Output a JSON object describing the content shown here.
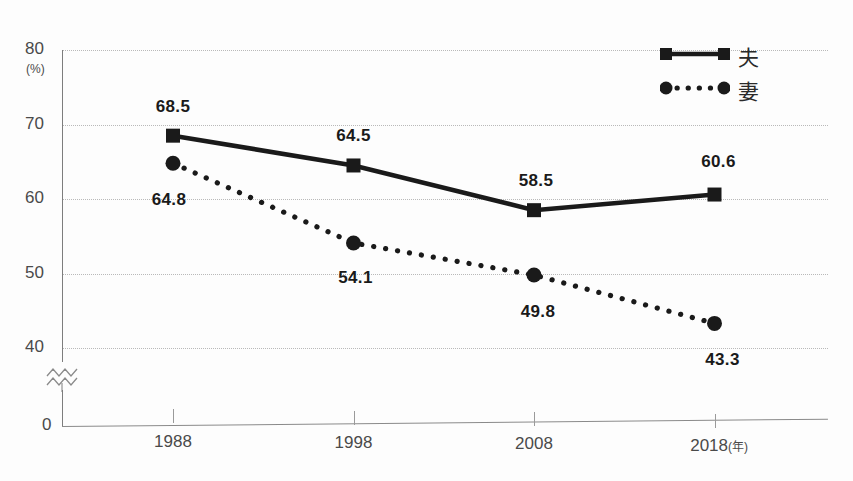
{
  "figure": {
    "caption": "",
    "background_color": "#fdfdfd",
    "ink_color": "#1a1a1a",
    "grid_color": "#b9b9b9"
  },
  "legend": {
    "position": "top-right",
    "entries": [
      {
        "label": "夫",
        "marker": "square",
        "line_style": "solid",
        "icon": "legend-line-solid-square-icon"
      },
      {
        "label": "妻",
        "marker": "circle",
        "line_style": "dotted",
        "icon": "legend-line-dotted-circle-icon"
      }
    ]
  },
  "axes": {
    "y_unit": "(%)",
    "y_ticks": [
      "80",
      "70",
      "60",
      "50",
      "40"
    ],
    "y_zero": "0",
    "y_break_icon": "axis-break-zigzag-icon",
    "x_ticks": [
      "1988",
      "1998",
      "2008",
      "2018"
    ],
    "x_unit": "(年)"
  },
  "chart_data": {
    "type": "line",
    "title": "",
    "xlabel": "年",
    "ylabel": "(%)",
    "x": [
      1988,
      1998,
      2008,
      2018
    ],
    "categories": [
      "1988",
      "1998",
      "2008",
      "2018"
    ],
    "ylim": [
      35,
      80
    ],
    "yticks": [
      40,
      50,
      60,
      70,
      80
    ],
    "axis_break": true,
    "grid": true,
    "legend_position": "top-right",
    "series": [
      {
        "name": "夫",
        "marker": "square",
        "line_style": "solid",
        "color": "#1a1a1a",
        "values": [
          68.5,
          64.5,
          58.5,
          60.6
        ],
        "labels": [
          "68.5",
          "64.5",
          "58.5",
          "60.6"
        ]
      },
      {
        "name": "妻",
        "marker": "circle",
        "line_style": "dotted",
        "color": "#1a1a1a",
        "values": [
          64.8,
          54.1,
          49.8,
          43.3
        ],
        "labels": [
          "64.8",
          "54.1",
          "49.8",
          "43.3"
        ]
      }
    ]
  }
}
